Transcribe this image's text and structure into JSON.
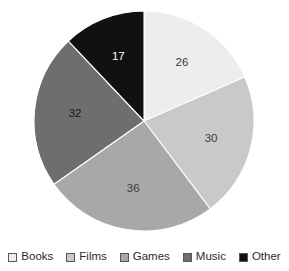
{
  "chart_data": {
    "type": "pie",
    "title": "",
    "categories": [
      "Books",
      "Films",
      "Games",
      "Music",
      "Other"
    ],
    "values": [
      26,
      30,
      36,
      32,
      17
    ],
    "total": 141,
    "data_labels": [
      "26",
      "30",
      "36",
      "32",
      "17"
    ],
    "start_angle_deg": 0,
    "direction": "clockwise",
    "legend_position": "bottom",
    "grid": false,
    "colors": [
      "#ededed",
      "#c9c9c9",
      "#a8a8a8",
      "#6e6e6e",
      "#111111"
    ],
    "label_colors": [
      "#3b3b3b",
      "#3b3b3b",
      "#3b3b3b",
      "#1a1a1a",
      "#ffffff"
    ],
    "slice_border_color": "#ffffff",
    "background": "#ffffff",
    "geometry": {
      "center_x": 144,
      "center_y": 121,
      "radius": 110,
      "label_radius_factor": 0.63
    }
  },
  "legend": {
    "items": [
      {
        "label": "Books",
        "color": "#ededed"
      },
      {
        "label": "Films",
        "color": "#c9c9c9"
      },
      {
        "label": "Games",
        "color": "#a8a8a8"
      },
      {
        "label": "Music",
        "color": "#6e6e6e"
      },
      {
        "label": "Other",
        "color": "#111111"
      }
    ]
  }
}
